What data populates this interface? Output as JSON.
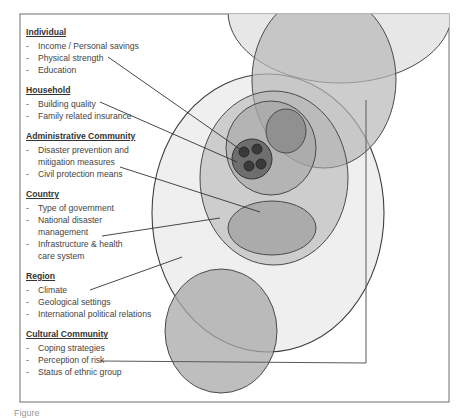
{
  "diagram": {
    "groups": [
      {
        "title": "Individual",
        "items": [
          "Income / Personal savings",
          "Physical strength",
          "Education"
        ]
      },
      {
        "title": "Household",
        "items": [
          "Building quality",
          "Family related insurance"
        ]
      },
      {
        "title": "Administrative Community",
        "items": [
          "Disaster prevention and mitigation measures",
          "Civil protection means"
        ]
      },
      {
        "title": "Country",
        "items": [
          "Type of government",
          "National disaster management",
          "Infrastructure & health care system"
        ]
      },
      {
        "title": "Region",
        "items": [
          "Climate",
          "Geological settings",
          "International political relations"
        ]
      },
      {
        "title": "Cultural Community",
        "items": [
          "Coping strategies",
          "Perception of risk",
          "Status of ethnic group"
        ]
      }
    ],
    "bullet": "-",
    "caption": "Figure"
  },
  "colors": {
    "border": "#6e6e6e",
    "outline": "#4a4a4a",
    "region_fill": "#ececec",
    "country_fill": "#c8c8c8",
    "admin_fill": "#b2b2b2",
    "inner_dark_fill": "#9a9a9a",
    "household_fill": "#6e6e6e",
    "individual_fill": "#4a4a4a",
    "top_cap_fill": "#e6e6e6",
    "tall_ellipse_fill": "#c4c4c4",
    "cultural_fill": "#b8b8b8"
  }
}
